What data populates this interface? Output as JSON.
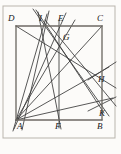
{
  "figure": {
    "type": "line-diagram",
    "canvas": {
      "width": 121,
      "height": 154,
      "background": "#fcfbf9"
    },
    "frame": {
      "x": 3,
      "y": 6,
      "width": 112,
      "height": 132,
      "stroke": "#b9b5ad",
      "stroke_width": 1
    },
    "colors": {
      "ink": "#2b2b2b",
      "rect_stroke": "#6e6a64",
      "line_stroke": "#3a3a3a",
      "frame_stroke": "#b9b5ad",
      "label_color": "#1a1a1a",
      "background": "#fcfbf9"
    },
    "points": [
      {
        "id": "A",
        "label": "A",
        "x": 16,
        "y": 120,
        "label_x": 17,
        "label_y": 122,
        "role": "rectangle-vertex-bottom-left"
      },
      {
        "id": "B",
        "label": "B",
        "x": 102,
        "y": 120,
        "label_x": 97,
        "label_y": 122,
        "role": "rectangle-vertex-bottom-right"
      },
      {
        "id": "C",
        "label": "C",
        "x": 102,
        "y": 26,
        "label_x": 97,
        "label_y": 14,
        "role": "rectangle-vertex-top-right"
      },
      {
        "id": "D",
        "label": "D",
        "x": 16,
        "y": 26,
        "label_x": 8,
        "label_y": 14,
        "role": "rectangle-vertex-top-left"
      },
      {
        "id": "E",
        "label": "E",
        "x": 59,
        "y": 26,
        "label_x": 58,
        "label_y": 14,
        "role": "top-edge-point"
      },
      {
        "id": "F",
        "label": "F",
        "x": 59,
        "y": 120,
        "label_x": 55,
        "label_y": 122,
        "role": "bottom-edge-point"
      },
      {
        "id": "I",
        "label": "I",
        "x": 42,
        "y": 26,
        "label_x": 39,
        "label_y": 14,
        "role": "top-edge-concurrency-point"
      },
      {
        "id": "G",
        "label": "G",
        "x": 62,
        "y": 40,
        "label_x": 63,
        "label_y": 33,
        "role": "interior-intersection"
      },
      {
        "id": "H",
        "label": "H",
        "x": 100,
        "y": 72,
        "label_x": 98,
        "label_y": 75,
        "role": "right-edge-intersection"
      },
      {
        "id": "K",
        "label": "K",
        "x": 101,
        "y": 105,
        "label_x": 99,
        "label_y": 109,
        "role": "right-edge-intersection"
      }
    ],
    "rectangle": {
      "name": "ABCD",
      "vertices": [
        "D",
        "C",
        "B",
        "A"
      ],
      "left": 16,
      "top": 26,
      "right": 102,
      "bottom": 120
    },
    "segments": [
      {
        "name": "rect-top-DC",
        "x1": 16,
        "y1": 26,
        "x2": 102,
        "y2": 26,
        "kind": "rectangle"
      },
      {
        "name": "rect-right-CB",
        "x1": 102,
        "y1": 26,
        "x2": 102,
        "y2": 120,
        "kind": "rectangle"
      },
      {
        "name": "rect-bottom-BA",
        "x1": 102,
        "y1": 120,
        "x2": 16,
        "y2": 120,
        "kind": "rectangle"
      },
      {
        "name": "rect-left-AD",
        "x1": 16,
        "y1": 120,
        "x2": 16,
        "y2": 26,
        "kind": "rectangle"
      },
      {
        "name": "median-EF",
        "x1": 59,
        "y1": 20,
        "x2": 59,
        "y2": 128,
        "kind": "construction"
      },
      {
        "name": "line-A-to-I-ext",
        "x1": 13,
        "y1": 131,
        "x2": 47,
        "y2": 14,
        "kind": "cevian"
      },
      {
        "name": "line-A-to-E-ext",
        "x1": 14,
        "y1": 129,
        "x2": 66,
        "y2": 13,
        "kind": "cevian"
      },
      {
        "name": "line-A-to-G",
        "x1": 16,
        "y1": 120,
        "x2": 75,
        "y2": 20,
        "kind": "cevian"
      },
      {
        "name": "line-A-to-H",
        "x1": 16,
        "y1": 120,
        "x2": 109,
        "y2": 67,
        "kind": "cevian"
      },
      {
        "name": "line-A-to-K",
        "x1": 16,
        "y1": 120,
        "x2": 113,
        "y2": 98,
        "kind": "cevian"
      },
      {
        "name": "line-A-to-C",
        "x1": 16,
        "y1": 120,
        "x2": 102,
        "y2": 26,
        "kind": "diagonal"
      },
      {
        "name": "line-I-to-B",
        "x1": 33,
        "y1": 9,
        "x2": 109,
        "y2": 116,
        "kind": "transversal"
      },
      {
        "name": "line-I-to-K",
        "x1": 36,
        "y1": 10,
        "x2": 104,
        "y2": 113,
        "kind": "transversal"
      },
      {
        "name": "line-I-down-left",
        "x1": 49,
        "y1": 11,
        "x2": 22,
        "y2": 130,
        "kind": "transversal"
      },
      {
        "name": "line-I-to-F",
        "x1": 38,
        "y1": 12,
        "x2": 61,
        "y2": 129,
        "kind": "transversal"
      },
      {
        "name": "line-D-to-H-ext",
        "x1": 16,
        "y1": 26,
        "x2": 116,
        "y2": 88,
        "kind": "transversal"
      },
      {
        "name": "line-G-to-B-ext",
        "x1": 45,
        "y1": 20,
        "x2": 116,
        "y2": 106,
        "kind": "transversal"
      },
      {
        "name": "line-through-H",
        "x1": 88,
        "y1": 80,
        "x2": 116,
        "y2": 62,
        "kind": "transversal"
      },
      {
        "name": "line-through-K",
        "x1": 88,
        "y1": 111,
        "x2": 116,
        "y2": 97,
        "kind": "transversal"
      }
    ],
    "labels_order": [
      "D",
      "I",
      "E",
      "C",
      "G",
      "H",
      "K",
      "A",
      "F",
      "B"
    ]
  }
}
